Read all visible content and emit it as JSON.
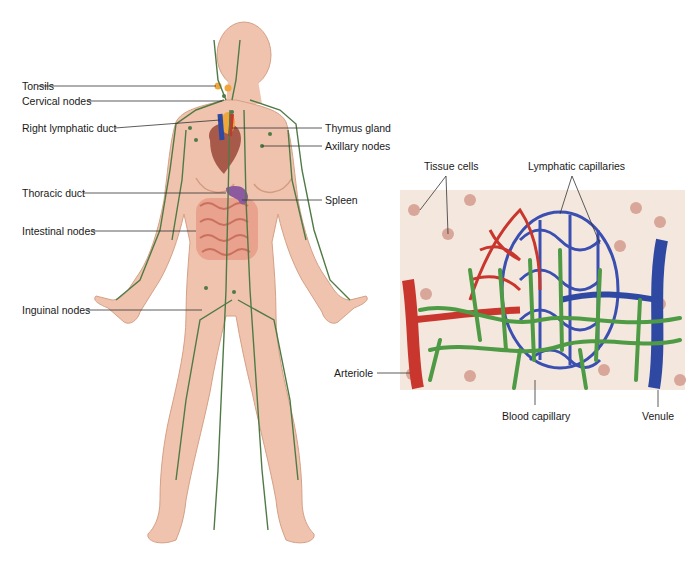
{
  "figure": {
    "body_labels_left": [
      {
        "id": "tonsils",
        "text": "Tonsils"
      },
      {
        "id": "cervical",
        "text": "Cervical nodes"
      },
      {
        "id": "right-duct",
        "text": "Right lymphatic duct"
      },
      {
        "id": "thoracic",
        "text": "Thoracic duct"
      },
      {
        "id": "intestinal",
        "text": "Intestinal nodes"
      },
      {
        "id": "inguinal",
        "text": "Inguinal nodes"
      }
    ],
    "body_labels_right": [
      {
        "id": "thymus",
        "text": "Thymus gland"
      },
      {
        "id": "axillary",
        "text": "Axillary nodes"
      },
      {
        "id": "spleen",
        "text": "Spleen"
      }
    ],
    "detail_labels": [
      {
        "id": "tissue",
        "text": "Tissue cells"
      },
      {
        "id": "lymph-cap",
        "text": "Lymphatic capillaries"
      },
      {
        "id": "arteriole",
        "text": "Arteriole"
      },
      {
        "id": "blood-cap",
        "text": "Blood capillary"
      },
      {
        "id": "venule",
        "text": "Venule"
      }
    ],
    "colors": {
      "skin": "#efc3ad",
      "skin_shade": "#d99f86",
      "lymph": "#4f7a46",
      "artery": "#c8362d",
      "vein": "#2f49a3",
      "lymph_cap": "#4e9a45",
      "tissue_bg": "#f3e7dc",
      "cell": "#d9a69a"
    }
  }
}
